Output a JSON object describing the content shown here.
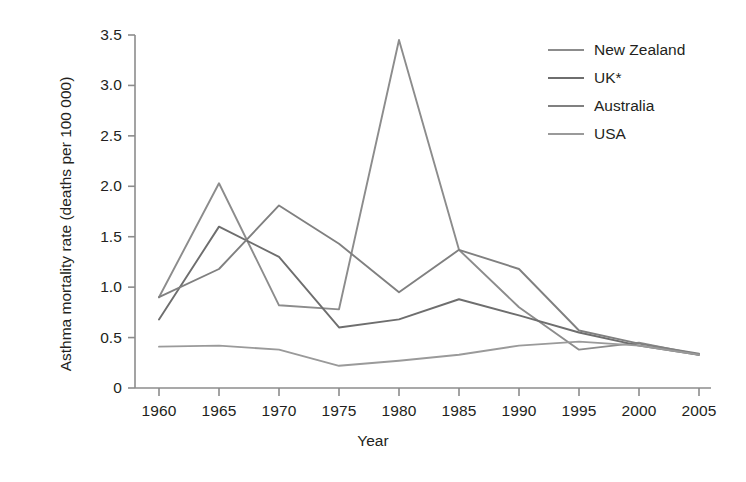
{
  "chart_data": {
    "type": "line",
    "title": "",
    "xlabel": "Year",
    "ylabel": "Asthma mortality rate (deaths per 100 000)",
    "x": [
      1960,
      1965,
      1970,
      1975,
      1980,
      1985,
      1990,
      1995,
      2000,
      2005
    ],
    "xlim": [
      1958,
      2006
    ],
    "ylim": [
      0,
      3.5
    ],
    "xticks": [
      "1960",
      "1965",
      "1970",
      "1975",
      "1980",
      "1985",
      "1990",
      "1995",
      "2000",
      "2005"
    ],
    "yticks": [
      "0",
      "0.5",
      "1.0",
      "1.5",
      "2.0",
      "2.5",
      "3.0",
      "3.5"
    ],
    "grid": false,
    "legend_position": "top-right",
    "series": [
      {
        "name": "New Zealand",
        "color": "#8c8c8c",
        "values": [
          0.9,
          2.03,
          0.82,
          0.78,
          3.45,
          1.37,
          0.8,
          0.38,
          0.45,
          0.33
        ]
      },
      {
        "name": "UK*",
        "color": "#6e6e6e",
        "values": [
          0.68,
          1.6,
          1.3,
          0.6,
          0.68,
          0.88,
          0.72,
          0.55,
          0.42,
          0.33
        ]
      },
      {
        "name": "Australia",
        "color": "#808080",
        "values": [
          0.9,
          1.18,
          1.81,
          1.43,
          0.95,
          1.37,
          1.18,
          0.57,
          0.44,
          0.34
        ]
      },
      {
        "name": "USA",
        "color": "#9a9a9a",
        "values": [
          0.41,
          0.42,
          0.38,
          0.22,
          0.27,
          0.33,
          0.42,
          0.46,
          0.42,
          0.33
        ]
      }
    ]
  },
  "axes": {
    "x_title": "Year",
    "y_title": "Asthma mortality rate (deaths per 100 000)",
    "y_tick_labels": [
      "3.5",
      "3.0",
      "2.5",
      "2.0",
      "1.5",
      "1.0",
      "0.5",
      "0"
    ],
    "x_tick_labels": [
      "1960",
      "1965",
      "1970",
      "1975",
      "1980",
      "1985",
      "1990",
      "1995",
      "2000",
      "2005"
    ],
    "axis_color": "#8c8c8c"
  },
  "legend": {
    "items": [
      {
        "label": "New Zealand",
        "color": "#8c8c8c"
      },
      {
        "label": "UK*",
        "color": "#6e6e6e"
      },
      {
        "label": "Australia",
        "color": "#808080"
      },
      {
        "label": "USA",
        "color": "#9a9a9a"
      }
    ]
  }
}
